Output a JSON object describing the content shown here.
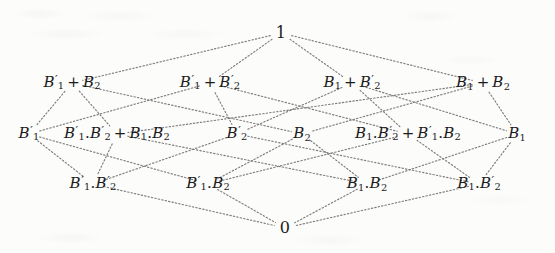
{
  "figure": {
    "type": "hasse-diagram",
    "name": "Boolean lattice of functions of two variables",
    "background_color": "#fcfcfb",
    "ink_color": "#1b1b1b",
    "edge_style": "dotted"
  },
  "nodes": {
    "top": {
      "id": "top",
      "label": "1",
      "x": 281,
      "y": 33,
      "level": 0
    },
    "bottom": {
      "id": "bottom",
      "label": "0",
      "x": 285,
      "y": 228,
      "level": 4
    },
    "level1": [
      {
        "id": "n1",
        "x": 72,
        "y": 83,
        "terms": [
          {
            "v": "B",
            "sub": "1",
            "prime": true
          },
          {
            "op": "+"
          },
          {
            "v": "B",
            "sub": "2",
            "prime": false
          }
        ]
      },
      {
        "id": "n2",
        "x": 210,
        "y": 83,
        "terms": [
          {
            "v": "B",
            "sub": "1",
            "prime": true
          },
          {
            "op": "+"
          },
          {
            "v": "B",
            "sub": "2",
            "prime": true
          }
        ]
      },
      {
        "id": "n3",
        "x": 352,
        "y": 83,
        "terms": [
          {
            "v": "B",
            "sub": "1",
            "prime": false
          },
          {
            "op": "+"
          },
          {
            "v": "B",
            "sub": "2",
            "prime": true
          }
        ]
      },
      {
        "id": "n4",
        "x": 483,
        "y": 83,
        "terms": [
          {
            "v": "B",
            "sub": "1",
            "prime": false
          },
          {
            "op": "+"
          },
          {
            "v": "B",
            "sub": "2",
            "prime": false
          }
        ]
      }
    ],
    "level2": [
      {
        "id": "m1",
        "x": 29,
        "y": 134,
        "terms": [
          {
            "v": "B",
            "sub": "1",
            "prime": true
          }
        ]
      },
      {
        "id": "m2",
        "x": 117,
        "y": 134,
        "terms": [
          {
            "v": "B",
            "sub": "1",
            "prime": true
          },
          {
            "dot": "."
          },
          {
            "v": "B",
            "sub": "2",
            "prime": true
          },
          {
            "op": "+"
          },
          {
            "v": "B",
            "sub": "1",
            "prime": false
          },
          {
            "dot": "."
          },
          {
            "v": "B",
            "sub": "2",
            "prime": false
          }
        ]
      },
      {
        "id": "m3",
        "x": 237,
        "y": 134,
        "terms": [
          {
            "v": "B",
            "sub": "2",
            "prime": true
          }
        ]
      },
      {
        "id": "m4",
        "x": 302,
        "y": 134,
        "terms": [
          {
            "v": "B",
            "sub": "2",
            "prime": false
          }
        ]
      },
      {
        "id": "m5",
        "x": 408,
        "y": 134,
        "terms": [
          {
            "v": "B",
            "sub": "1",
            "prime": false
          },
          {
            "dot": "."
          },
          {
            "v": "B",
            "sub": "2",
            "prime": true
          },
          {
            "op": "+"
          },
          {
            "v": "B",
            "sub": "1",
            "prime": true
          },
          {
            "dot": "."
          },
          {
            "v": "B",
            "sub": "2",
            "prime": false
          }
        ]
      },
      {
        "id": "m6",
        "x": 517,
        "y": 134,
        "terms": [
          {
            "v": "B",
            "sub": "1",
            "prime": false
          }
        ]
      }
    ],
    "level3": [
      {
        "id": "b1",
        "x": 93,
        "y": 184,
        "terms": [
          {
            "v": "B",
            "sub": "1",
            "prime": true
          },
          {
            "dot": "."
          },
          {
            "v": "B",
            "sub": "2",
            "prime": true
          }
        ]
      },
      {
        "id": "b2",
        "x": 208,
        "y": 184,
        "terms": [
          {
            "v": "B",
            "sub": "1",
            "prime": true
          },
          {
            "dot": "."
          },
          {
            "v": "B",
            "sub": "2",
            "prime": false
          }
        ]
      },
      {
        "id": "b3",
        "x": 367,
        "y": 184,
        "terms": [
          {
            "v": "B",
            "sub": "1",
            "prime": false
          },
          {
            "dot": "."
          },
          {
            "v": "B",
            "sub": "2",
            "prime": false
          }
        ]
      },
      {
        "id": "b4",
        "x": 479,
        "y": 184,
        "terms": [
          {
            "v": "B",
            "sub": "1",
            "prime": false
          },
          {
            "dot": "."
          },
          {
            "v": "B",
            "sub": "2",
            "prime": true
          }
        ]
      }
    ]
  },
  "edges": [
    {
      "from": "top",
      "to": "n1"
    },
    {
      "from": "top",
      "to": "n2"
    },
    {
      "from": "top",
      "to": "n3"
    },
    {
      "from": "top",
      "to": "n4"
    },
    {
      "from": "n1",
      "to": "m1"
    },
    {
      "from": "n1",
      "to": "m2"
    },
    {
      "from": "n1",
      "to": "m4"
    },
    {
      "from": "n2",
      "to": "m1"
    },
    {
      "from": "n2",
      "to": "m3"
    },
    {
      "from": "n2",
      "to": "m5"
    },
    {
      "from": "n3",
      "to": "m3"
    },
    {
      "from": "n3",
      "to": "m5"
    },
    {
      "from": "n3",
      "to": "m6"
    },
    {
      "from": "n4",
      "to": "m2"
    },
    {
      "from": "n4",
      "to": "m4"
    },
    {
      "from": "n4",
      "to": "m6"
    },
    {
      "from": "m1",
      "to": "b1"
    },
    {
      "from": "m1",
      "to": "b2"
    },
    {
      "from": "m2",
      "to": "b1"
    },
    {
      "from": "m2",
      "to": "b3"
    },
    {
      "from": "m3",
      "to": "b1"
    },
    {
      "from": "m3",
      "to": "b4"
    },
    {
      "from": "m4",
      "to": "b2"
    },
    {
      "from": "m4",
      "to": "b3"
    },
    {
      "from": "m5",
      "to": "b2"
    },
    {
      "from": "m5",
      "to": "b4"
    },
    {
      "from": "m6",
      "to": "b3"
    },
    {
      "from": "m6",
      "to": "b4"
    },
    {
      "from": "b1",
      "to": "bottom"
    },
    {
      "from": "b2",
      "to": "bottom"
    },
    {
      "from": "b3",
      "to": "bottom"
    },
    {
      "from": "b4",
      "to": "bottom"
    }
  ]
}
